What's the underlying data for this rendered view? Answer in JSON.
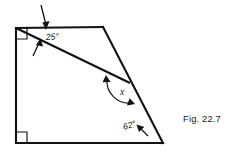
{
  "figure": {
    "caption": "Fig. 22.7",
    "type": "geometry-diagram",
    "background_color": "#ffffff",
    "line_color": "#111111",
    "shape": {
      "name": "quadrilateral",
      "vertices": [
        {
          "id": "top-left",
          "x": 16,
          "y": 28,
          "label": "A"
        },
        {
          "id": "top-right",
          "x": 103,
          "y": 27,
          "label": "B"
        },
        {
          "id": "bottom-right",
          "x": 163,
          "y": 143,
          "label": "C"
        },
        {
          "id": "bottom-left",
          "x": 16,
          "y": 143,
          "label": "D"
        }
      ]
    },
    "transversal": {
      "from": {
        "x": 16,
        "y": 28
      },
      "to": {
        "x": 130,
        "y": 83
      },
      "description": "line from top-left vertex to a point on the slanted right edge"
    },
    "right_angle_marks": [
      {
        "at": "top-left",
        "x": 16,
        "y": 28,
        "size": 11
      },
      {
        "at": "bottom-left",
        "x": 16,
        "y": 143,
        "size": 11
      }
    ],
    "angles": [
      {
        "id": "angle-25",
        "value": "25",
        "unit": "degrees",
        "label": "25°",
        "label_x": 46,
        "label_y": 40,
        "marker": "double-arrow",
        "location": "between top edge and transversal at top-left vertex"
      },
      {
        "id": "angle-x",
        "value": "x",
        "unit": "",
        "label": "x",
        "label_x": 120,
        "label_y": 95,
        "marker": "arc-double-arrow",
        "location": "between transversal and slanted right edge (interior)"
      },
      {
        "id": "angle-62",
        "value": "62",
        "unit": "degrees",
        "label": "62°",
        "label_x": 124,
        "label_y": 130,
        "marker": "single-arrow",
        "location": "between bottom edge and slanted right edge at bottom-right vertex"
      }
    ]
  }
}
